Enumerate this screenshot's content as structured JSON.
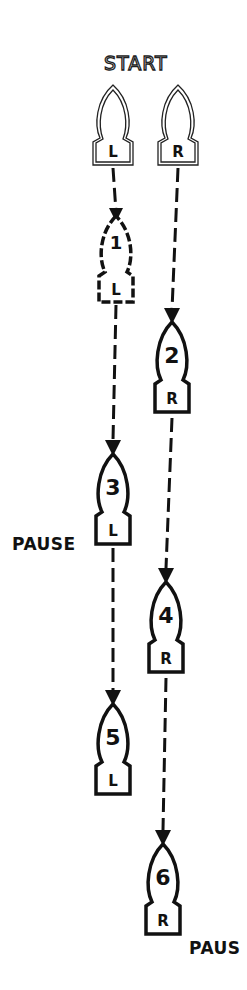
{
  "title": "START",
  "labels": {
    "pause_left": "PAUSE",
    "pause_right": "PAUS"
  },
  "start_shoes": [
    {
      "foot": "L",
      "cx": 113,
      "top": 85
    },
    {
      "foot": "R",
      "cx": 178,
      "top": 85
    }
  ],
  "steps": [
    {
      "number": "1",
      "foot": "L",
      "cx": 116,
      "top": 212,
      "style": "outline-dashed"
    },
    {
      "number": "2",
      "foot": "R",
      "cx": 172,
      "top": 318,
      "style": "solid"
    },
    {
      "number": "3",
      "foot": "L",
      "cx": 113,
      "top": 450,
      "style": "solid"
    },
    {
      "number": "4",
      "foot": "R",
      "cx": 166,
      "top": 578,
      "style": "solid"
    },
    {
      "number": "5",
      "foot": "L",
      "cx": 113,
      "top": 700,
      "style": "solid"
    },
    {
      "number": "6",
      "foot": "R",
      "cx": 163,
      "top": 840,
      "style": "solid"
    }
  ],
  "colors": {
    "ink": "#111111",
    "background": "#ffffff"
  }
}
